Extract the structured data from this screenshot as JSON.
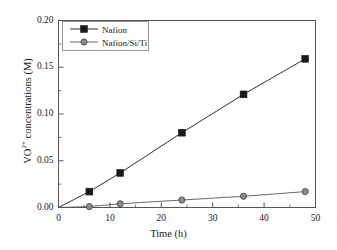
{
  "chart_data": {
    "type": "line",
    "title": "",
    "xlabel": "Time (h)",
    "ylabel": "VO2+ concentrations (M)",
    "ylabel_base": "VO",
    "ylabel_sup": "2+",
    "ylabel_rest": " concentrations (M)",
    "xlim": [
      0,
      50
    ],
    "ylim": [
      0.0,
      0.2
    ],
    "xticks": [
      0,
      10,
      20,
      30,
      40,
      50
    ],
    "xtick_labels": [
      "0",
      "10",
      "20",
      "30",
      "40",
      "50"
    ],
    "yticks": [
      0.0,
      0.05,
      0.1,
      0.15,
      0.2
    ],
    "ytick_labels": [
      "0.00",
      "0.05",
      "0.10",
      "0.15",
      "0.20"
    ],
    "x_minor_step": 5,
    "y_minor_step": 0.025,
    "grid": false,
    "legend_position": "upper-left-inside",
    "x": [
      0,
      6,
      12,
      24,
      36,
      48
    ],
    "series": [
      {
        "name": "Nafion",
        "marker": "square",
        "color": "#1a1a1a",
        "values": [
          0.0,
          0.017,
          0.037,
          0.08,
          0.121,
          0.159
        ]
      },
      {
        "name": "Nafion/Si/Ti",
        "marker": "circle",
        "color": "#5a5a5a",
        "values": [
          0.0,
          0.001,
          0.004,
          0.008,
          0.012,
          0.017
        ]
      }
    ]
  },
  "legend": {
    "entries": [
      {
        "label": "Nafion"
      },
      {
        "label": "Nafion/Si/Ti"
      }
    ]
  },
  "colors": {
    "axis": "#4d4d4d",
    "series1": "#1a1a1a",
    "series2": "#6b6b6b",
    "background": "#ffffff"
  }
}
